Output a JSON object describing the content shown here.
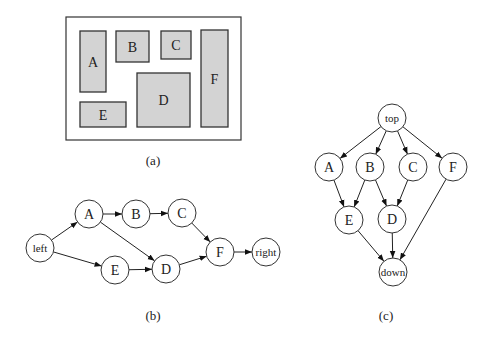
{
  "panel_a": {
    "caption": "(a)",
    "frame": {
      "x": 66,
      "y": 17,
      "w": 175,
      "h": 123
    },
    "boxes": [
      {
        "label": "A",
        "x": 80,
        "y": 31,
        "w": 26,
        "h": 61
      },
      {
        "label": "B",
        "x": 116,
        "y": 31,
        "w": 33,
        "h": 31
      },
      {
        "label": "C",
        "x": 161,
        "y": 31,
        "w": 30,
        "h": 28
      },
      {
        "label": "D",
        "x": 137,
        "y": 73,
        "w": 53,
        "h": 54
      },
      {
        "label": "E",
        "x": 80,
        "y": 102,
        "w": 46,
        "h": 25
      },
      {
        "label": "F",
        "x": 201,
        "y": 30,
        "w": 27,
        "h": 97
      }
    ]
  },
  "panel_b": {
    "caption": "(b)",
    "nodes": [
      {
        "id": "left",
        "label": "left",
        "x": 40,
        "y": 248
      },
      {
        "id": "A",
        "label": "A",
        "x": 89,
        "y": 214
      },
      {
        "id": "B",
        "label": "B",
        "x": 136,
        "y": 214
      },
      {
        "id": "C",
        "label": "C",
        "x": 182,
        "y": 213
      },
      {
        "id": "E",
        "label": "E",
        "x": 115,
        "y": 270
      },
      {
        "id": "D",
        "label": "D",
        "x": 166,
        "y": 269
      },
      {
        "id": "F",
        "label": "F",
        "x": 220,
        "y": 252
      },
      {
        "id": "right",
        "label": "right",
        "x": 266,
        "y": 252
      }
    ],
    "edges": [
      [
        "left",
        "A"
      ],
      [
        "left",
        "E"
      ],
      [
        "A",
        "B"
      ],
      [
        "A",
        "D"
      ],
      [
        "B",
        "C"
      ],
      [
        "E",
        "D"
      ],
      [
        "C",
        "F"
      ],
      [
        "D",
        "F"
      ],
      [
        "F",
        "right"
      ]
    ]
  },
  "panel_c": {
    "caption": "(c)",
    "nodes": [
      {
        "id": "top",
        "label": "top",
        "x": 392,
        "y": 118
      },
      {
        "id": "A",
        "label": "A",
        "x": 329,
        "y": 167
      },
      {
        "id": "B",
        "label": "B",
        "x": 370,
        "y": 167
      },
      {
        "id": "C",
        "label": "C",
        "x": 413,
        "y": 167
      },
      {
        "id": "F",
        "label": "F",
        "x": 453,
        "y": 167
      },
      {
        "id": "E",
        "label": "E",
        "x": 349,
        "y": 220
      },
      {
        "id": "D",
        "label": "D",
        "x": 392,
        "y": 219
      },
      {
        "id": "down",
        "label": "down",
        "x": 393,
        "y": 272
      }
    ],
    "edges": [
      [
        "top",
        "A"
      ],
      [
        "top",
        "B"
      ],
      [
        "top",
        "C"
      ],
      [
        "top",
        "F"
      ],
      [
        "A",
        "E"
      ],
      [
        "B",
        "E"
      ],
      [
        "B",
        "D"
      ],
      [
        "C",
        "D"
      ],
      [
        "E",
        "down"
      ],
      [
        "D",
        "down"
      ],
      [
        "F",
        "down"
      ]
    ]
  },
  "node_radius": 14,
  "captions_pos": {
    "a": [
      153,
      165
    ],
    "b": [
      153,
      320
    ],
    "c": [
      386,
      320
    ]
  }
}
